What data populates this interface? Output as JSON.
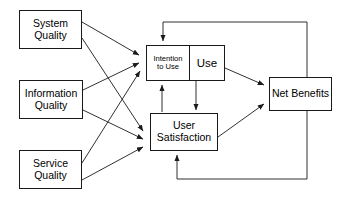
{
  "diagram": {
    "type": "flow-diagram",
    "width": 346,
    "height": 204,
    "background_color": "#ffffff",
    "stroke_color": "#1a1a1a",
    "text_color": "#000000",
    "nodes": [
      {
        "id": "system_quality",
        "label": "System\nQuality",
        "x": 19,
        "y": 10,
        "w": 63,
        "h": 39
      },
      {
        "id": "information_quality",
        "label": "Information\nQuality",
        "x": 19,
        "y": 80,
        "w": 64,
        "h": 39
      },
      {
        "id": "service_quality",
        "label": "Service\nQuality",
        "x": 19,
        "y": 150,
        "w": 63,
        "h": 39
      },
      {
        "id": "intention_to_use",
        "label": "Intention\nto Use",
        "x": 146,
        "y": 45,
        "w": 44,
        "h": 36
      },
      {
        "id": "use",
        "label": "Use",
        "x": 189,
        "y": 45,
        "w": 36,
        "h": 36
      },
      {
        "id": "user_satisfaction",
        "label": "User\nSatisfaction",
        "x": 150,
        "y": 113,
        "w": 68,
        "h": 38
      },
      {
        "id": "net_benefits",
        "label": "Net Benefits",
        "x": 269,
        "y": 77,
        "w": 63,
        "h": 34
      }
    ],
    "edges": [
      {
        "id": "sq-itu",
        "from": "system_quality",
        "to": "intention_to_use",
        "kind": "arrow"
      },
      {
        "id": "sq-us",
        "from": "system_quality",
        "to": "user_satisfaction",
        "kind": "arrow"
      },
      {
        "id": "iq-itu",
        "from": "information_quality",
        "to": "intention_to_use",
        "kind": "arrow"
      },
      {
        "id": "iq-us",
        "from": "information_quality",
        "to": "user_satisfaction",
        "kind": "arrow"
      },
      {
        "id": "svq-itu",
        "from": "service_quality",
        "to": "intention_to_use",
        "kind": "arrow"
      },
      {
        "id": "svq-us",
        "from": "service_quality",
        "to": "user_satisfaction",
        "kind": "arrow"
      },
      {
        "id": "use-us",
        "from": "use",
        "to": "user_satisfaction",
        "kind": "arrow"
      },
      {
        "id": "us-itu",
        "from": "user_satisfaction",
        "to": "intention_to_use",
        "kind": "arrow"
      },
      {
        "id": "use-nb",
        "from": "use",
        "to": "net_benefits",
        "kind": "arrow"
      },
      {
        "id": "us-nb",
        "from": "user_satisfaction",
        "to": "net_benefits",
        "kind": "arrow"
      },
      {
        "id": "nb-itu",
        "from": "net_benefits",
        "to": "intention_to_use",
        "kind": "feedback-top"
      },
      {
        "id": "nb-us",
        "from": "net_benefits",
        "to": "user_satisfaction",
        "kind": "feedback-bottom"
      }
    ]
  }
}
